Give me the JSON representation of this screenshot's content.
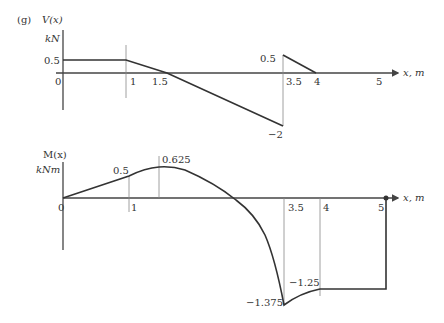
{
  "figure_label": "(g)",
  "shear": {
    "title": "V(x)",
    "unit": "kN",
    "x_axis_label": "x, m",
    "origin_label": "0",
    "x_ticks": [
      "1",
      "1.5",
      "3.5",
      "4",
      "5"
    ],
    "value_labels": {
      "left_plateau": "0.5",
      "jump_top": "0.5",
      "min": "−2"
    },
    "points": [
      [
        0,
        0.5
      ],
      [
        1,
        0.5
      ],
      [
        1.5,
        0
      ],
      [
        3.5,
        -2
      ],
      [
        3.5,
        0.5
      ],
      [
        4,
        0
      ],
      [
        5,
        0
      ]
    ]
  },
  "moment": {
    "title": "M(x)",
    "unit": "kNm",
    "x_axis_label": "x, m",
    "origin_label": "0",
    "x_ticks": [
      "1",
      "3.5",
      "4",
      "5"
    ],
    "value_labels": {
      "at_1": "0.5",
      "peak": "0.625",
      "at_4": "−1.25",
      "min": "−1.375"
    },
    "points": [
      [
        0,
        0
      ],
      [
        1,
        0.5
      ],
      [
        1.5,
        0.625
      ],
      [
        3.5,
        -1.375
      ],
      [
        4,
        -1.25
      ],
      [
        5,
        -1.25
      ]
    ]
  },
  "colors": {
    "line": "#333333",
    "guide": "#888888",
    "background": "#ffffff"
  }
}
